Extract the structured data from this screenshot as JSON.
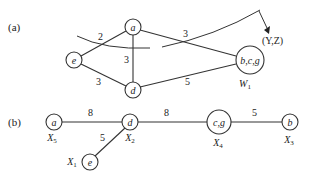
{
  "panels": {
    "a": {
      "label": "(a)",
      "nodes": {
        "a": "a",
        "e": "e",
        "d": "d",
        "w": "b,c,g",
        "w_sub_main": "W",
        "w_sub_idx": "1"
      },
      "edges": {
        "e_a": "2",
        "a_d": "3",
        "a_w": "3",
        "e_d": "3",
        "d_w": "5"
      },
      "cut_label": "(Y,Z)"
    },
    "b": {
      "label": "(b)",
      "nodes": {
        "a": "a",
        "d": "d",
        "e": "e",
        "cg": "c,g",
        "b": "b"
      },
      "node_labels": {
        "a": {
          "main": "X",
          "idx": "5"
        },
        "d": {
          "main": "X",
          "idx": "2"
        },
        "e": {
          "main": "X",
          "idx": "1"
        },
        "cg": {
          "main": "X",
          "idx": "4"
        },
        "b": {
          "main": "X",
          "idx": "3"
        }
      },
      "edges": {
        "a_d": "8",
        "d_e": "5",
        "d_cg": "8",
        "cg_b": "5"
      }
    }
  }
}
